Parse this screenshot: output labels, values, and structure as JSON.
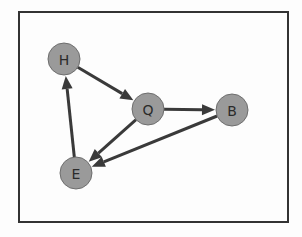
{
  "figure": {
    "title": "",
    "background_color": "#fdfdfd",
    "frame": {
      "x": 19,
      "y": 12,
      "width": 269,
      "height": 210,
      "stroke_color": "#333333",
      "stroke_width": 2
    }
  },
  "graph": {
    "type": "directed-graph",
    "node_style": {
      "fill_color": "#9a9a9a",
      "stroke_color": "#6e6e6e",
      "radius": 16,
      "label_color": "#2b2b2b"
    },
    "edge_style": {
      "stroke_color": "#3a3a3a",
      "stroke_width": 3,
      "arrow_length": 13,
      "arrow_width": 11
    },
    "nodes": [
      {
        "id": "H",
        "label": "H",
        "x": 64,
        "y": 59
      },
      {
        "id": "Q",
        "label": "Q",
        "x": 148,
        "y": 109
      },
      {
        "id": "B",
        "label": "B",
        "x": 232,
        "y": 110
      },
      {
        "id": "E",
        "label": "E",
        "x": 76,
        "y": 173
      }
    ],
    "edges": [
      {
        "id": "H-Q",
        "source": "H",
        "target": "Q",
        "directed": true
      },
      {
        "id": "Q-B",
        "source": "Q",
        "target": "B",
        "directed": true
      },
      {
        "id": "Q-E",
        "source": "Q",
        "target": "E",
        "directed": true
      },
      {
        "id": "B-E",
        "source": "B",
        "target": "E",
        "directed": true
      },
      {
        "id": "E-H",
        "source": "E",
        "target": "H",
        "directed": true
      }
    ]
  }
}
